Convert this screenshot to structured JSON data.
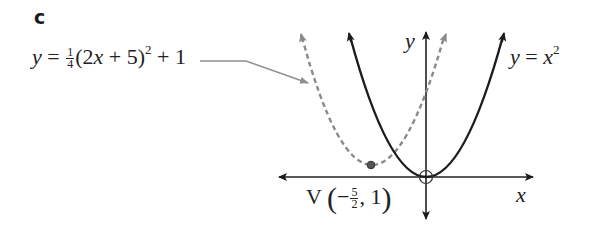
{
  "part_label": "c",
  "left_equation": {
    "lhs": "y",
    "equals": " = ",
    "coef_num": "1",
    "coef_den": "4",
    "body_open": "(2",
    "body_var": "x",
    "body_rest": " + 5)",
    "exponent": "2",
    "tail": " + 1",
    "full_text": "y = 1/4(2x + 5)^2 + 1"
  },
  "right_equation": {
    "lhs": "y",
    "equals": " = ",
    "var": "x",
    "exponent": "2",
    "full_text": "y = x^2"
  },
  "axes": {
    "x_label": "x",
    "y_label": "y"
  },
  "vertex_label": {
    "prefix": "V ",
    "open": "(",
    "sign": "−",
    "num": "5",
    "den": "2",
    "rest": ", 1",
    "close": ")",
    "full_text": "V(−5/2, 1)"
  },
  "colors": {
    "solid_curve": "#1c1c1c",
    "dashed_curve": "#8a8a8a",
    "axes": "#222222",
    "leader_line": "#8f8f8f",
    "vertex_dot": "#555555"
  },
  "curves": [
    {
      "name": "y = x^2",
      "style": "solid",
      "vertex": [
        0,
        0
      ]
    },
    {
      "name": "y = 1/4(2x+5)^2 + 1",
      "style": "dashed",
      "vertex": [
        -2.5,
        1
      ]
    }
  ]
}
